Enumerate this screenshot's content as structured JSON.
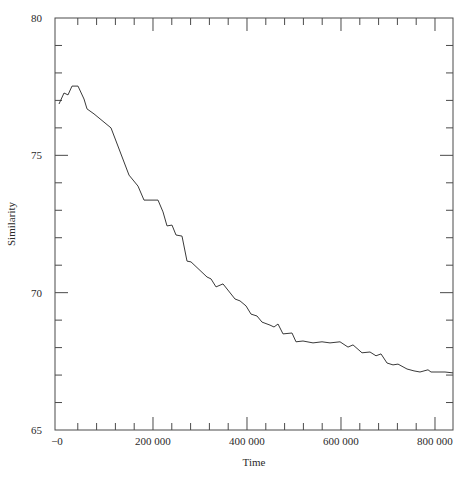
{
  "chart_data": {
    "type": "line",
    "title": "",
    "xlabel": "Time",
    "ylabel": "Similarity",
    "xlim": [
      -8500,
      838300
    ],
    "ylim": [
      65,
      80
    ],
    "grid": false,
    "legend": null,
    "x_ticks": [
      {
        "value": 0,
        "label": "−0"
      },
      {
        "value": 200000,
        "label": "200 000"
      },
      {
        "value": 400000,
        "label": "400 000"
      },
      {
        "value": 600000,
        "label": "600 000"
      },
      {
        "value": 800000,
        "label": "800 000"
      }
    ],
    "x_minor_step": 40000,
    "y_ticks": [
      {
        "value": 65,
        "label": "65"
      },
      {
        "value": 70,
        "label": "70"
      },
      {
        "value": 75,
        "label": "75"
      },
      {
        "value": 80,
        "label": "80"
      }
    ],
    "y_minor_step": 1,
    "series": [
      {
        "name": "Similarity",
        "color": "#3a3a3a",
        "x": [
          0,
          10600,
          19100,
          27700,
          40400,
          53200,
          59600,
          74500,
          110600,
          148900,
          168100,
          180900,
          210600,
          221300,
          229800,
          240400,
          248900,
          261700,
          272300,
          280900,
          314900,
          323400,
          334000,
          348900,
          374500,
          385100,
          397900,
          408500,
          421300,
          431900,
          448900,
          457400,
          466000,
          476600,
          495700,
          504300,
          519100,
          540400,
          559600,
          576600,
          597900,
          614900,
          625500,
          644700,
          661700,
          674500,
          685100,
          697900,
          710600,
          721300,
          740400,
          755300,
          768100,
          785100,
          791500,
          821300,
          838300
        ],
        "y": [
          76.87,
          77.27,
          77.2,
          77.52,
          77.52,
          77.05,
          76.69,
          76.51,
          76.0,
          74.28,
          73.88,
          73.37,
          73.37,
          72.94,
          72.43,
          72.46,
          72.1,
          72.06,
          71.15,
          71.12,
          70.57,
          70.5,
          70.21,
          70.32,
          69.77,
          69.7,
          69.52,
          69.22,
          69.15,
          68.93,
          68.82,
          68.75,
          68.86,
          68.5,
          68.53,
          68.21,
          68.24,
          68.17,
          68.21,
          68.17,
          68.21,
          68.02,
          68.1,
          67.81,
          67.84,
          67.7,
          67.77,
          67.44,
          67.37,
          67.4,
          67.22,
          67.15,
          67.11,
          67.19,
          67.11,
          67.11,
          67.08
        ]
      }
    ]
  }
}
